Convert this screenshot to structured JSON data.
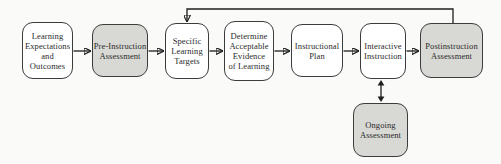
{
  "figure": {
    "type": "flowchart"
  },
  "boxes": [
    {
      "id": "learning-expectations",
      "label": "Learning\nExpectations\nand\nOutcomes",
      "shaded": false
    },
    {
      "id": "pre-instruction-assessment",
      "label": "Pre-Instruction\nAssessment",
      "shaded": true
    },
    {
      "id": "specific-learning-targets",
      "label": "Specific\nLearning\nTargets",
      "shaded": false
    },
    {
      "id": "determine-acceptable-evidence",
      "label": "Determine\nAcceptable\nEvidence\nof Learning",
      "shaded": false
    },
    {
      "id": "instructional-plan",
      "label": "Instructional\nPlan",
      "shaded": false
    },
    {
      "id": "interactive-instruction",
      "label": "Interactive\nInstruction",
      "shaded": false
    },
    {
      "id": "postinstruction-assessment",
      "label": "Postinstruction\nAssessment",
      "shaded": true
    },
    {
      "id": "ongoing-assessment",
      "label": "Ongoing\nAssessment",
      "shaded": true
    }
  ],
  "connectors": [
    {
      "from": "learning-expectations",
      "to": "pre-instruction-assessment",
      "style": "single-arrow"
    },
    {
      "from": "pre-instruction-assessment",
      "to": "specific-learning-targets",
      "style": "single-arrow"
    },
    {
      "from": "specific-learning-targets",
      "to": "determine-acceptable-evidence",
      "style": "single-arrow"
    },
    {
      "from": "determine-acceptable-evidence",
      "to": "instructional-plan",
      "style": "single-arrow"
    },
    {
      "from": "instructional-plan",
      "to": "interactive-instruction",
      "style": "single-arrow"
    },
    {
      "from": "interactive-instruction",
      "to": "postinstruction-assessment",
      "style": "single-arrow"
    },
    {
      "from": "postinstruction-assessment",
      "to": "specific-learning-targets",
      "style": "feedback-loop-arrow"
    },
    {
      "from": "interactive-instruction",
      "to": "ongoing-assessment",
      "style": "double-arrow"
    }
  ],
  "colors": {
    "background": "#fafaf8",
    "box_fill": "#ffffff",
    "shaded_fill": "#d8d8d4",
    "border": "#3c3c3c",
    "arrow": "#1e1e1e",
    "text": "#2b2b2b"
  }
}
